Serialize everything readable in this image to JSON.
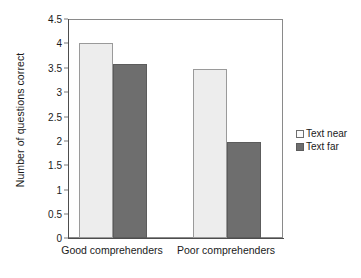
{
  "chart_data": {
    "type": "bar",
    "title": "",
    "xlabel": "",
    "ylabel": "Number of questions correct",
    "ylim": [
      0,
      4.5
    ],
    "yticks": [
      "0",
      "0.5",
      "1",
      "1.5",
      "2",
      "2.5",
      "3",
      "3.5",
      "4",
      "4.5"
    ],
    "ytick_values": [
      0,
      0.5,
      1,
      1.5,
      2,
      2.5,
      3,
      3.5,
      4,
      4.5
    ],
    "grid": false,
    "legend_position": "right",
    "categories": [
      "Good comprehenders",
      "Poor comprehenders"
    ],
    "series": [
      {
        "name": "Text near",
        "color": "#ededed",
        "edge_color": "#9a9a9a",
        "values": [
          4.0,
          3.47
        ]
      },
      {
        "name": "Text far",
        "color": "#6e6e6e",
        "edge_color": "#5c5c5c",
        "values": [
          3.57,
          1.98
        ]
      }
    ]
  },
  "axis": {
    "y_title": "Number of questions correct",
    "tick_0": "0",
    "tick_1": "0.5",
    "tick_2": "1",
    "tick_3": "1.5",
    "tick_4": "2",
    "tick_5": "2.5",
    "tick_6": "3",
    "tick_7": "3.5",
    "tick_8": "4",
    "tick_9": "4.5",
    "cat_0": "Good comprehenders",
    "cat_1": "Poor comprehenders"
  },
  "legend": {
    "item_0": "Text near",
    "item_1": "Text far"
  }
}
